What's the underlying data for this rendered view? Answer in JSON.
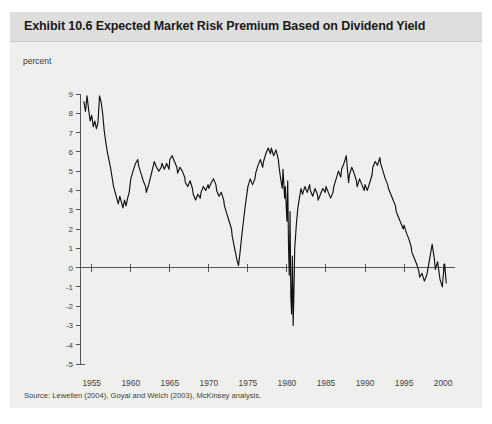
{
  "exhibit": {
    "title": "Exhibit 10.6 Expected Market Risk Premium Based on Dividend Yield",
    "unit_label": "percent",
    "source_note": "Source: Lewellen (2004), Goyal and Welch (2003), McKinsey analysis."
  },
  "colors": {
    "panel_background": "#efefed",
    "title_band": "#dededc",
    "series_line": "#121212",
    "axis": "#555555",
    "text": "#3f3f3f"
  },
  "chart_data": {
    "type": "line",
    "title": "Exhibit 10.6 Expected Market Risk Premium Based on Dividend Yield",
    "xlabel": "",
    "ylabel": "percent",
    "xlim": [
      1953.5,
      2000.5
    ],
    "ylim": [
      -5,
      9
    ],
    "grid": false,
    "legend": false,
    "x_ticks": [
      1955,
      1960,
      1965,
      1970,
      1975,
      1980,
      1985,
      1990,
      1995,
      2000
    ],
    "x_tick_labels": [
      "1955",
      "1960",
      "1965",
      "1970",
      "1975",
      "1980",
      "1985",
      "1990",
      "1995",
      "2000"
    ],
    "y_ticks": [
      9,
      8,
      7,
      6,
      5,
      4,
      3,
      2,
      1,
      0,
      -1,
      -2,
      -3,
      -4,
      -5
    ],
    "y_tick_labels": [
      "9",
      "8",
      "7",
      "6",
      "5",
      "4",
      "3",
      "2",
      "1",
      "0",
      "-1",
      "-2",
      "-3",
      "-4",
      "-5"
    ],
    "zero_line": 0,
    "series": [
      {
        "name": "Expected market risk premium",
        "x": [
          1954.0,
          1954.2,
          1954.4,
          1954.6,
          1954.8,
          1955.0,
          1955.2,
          1955.4,
          1955.6,
          1955.8,
          1956.0,
          1956.2,
          1956.4,
          1956.6,
          1956.8,
          1957.0,
          1957.2,
          1957.4,
          1957.6,
          1957.8,
          1958.0,
          1958.2,
          1958.4,
          1958.6,
          1958.8,
          1959.0,
          1959.2,
          1959.4,
          1959.6,
          1959.8,
          1960.0,
          1960.3,
          1960.6,
          1960.9,
          1961.0,
          1961.3,
          1961.6,
          1961.9,
          1962.0,
          1962.3,
          1962.6,
          1962.9,
          1963.0,
          1963.3,
          1963.6,
          1963.9,
          1964.0,
          1964.3,
          1964.6,
          1964.9,
          1965.0,
          1965.3,
          1965.6,
          1965.9,
          1966.0,
          1966.3,
          1966.6,
          1966.9,
          1967.0,
          1967.3,
          1967.6,
          1967.9,
          1968.0,
          1968.3,
          1968.6,
          1968.9,
          1969.0,
          1969.3,
          1969.6,
          1969.9,
          1970.0,
          1970.3,
          1970.6,
          1970.9,
          1971.0,
          1971.3,
          1971.6,
          1971.9,
          1972.0,
          1972.3,
          1972.6,
          1972.9,
          1973.0,
          1973.2,
          1973.4,
          1973.6,
          1973.8,
          1974.0,
          1974.2,
          1974.4,
          1974.6,
          1974.8,
          1975.0,
          1975.3,
          1975.6,
          1975.9,
          1976.0,
          1976.3,
          1976.6,
          1976.9,
          1977.0,
          1977.3,
          1977.6,
          1977.9,
          1978.0,
          1978.3,
          1978.6,
          1978.9,
          1979.0,
          1979.2,
          1979.4,
          1979.5,
          1979.6,
          1979.7,
          1979.8,
          1979.9,
          1980.0,
          1980.1,
          1980.2,
          1980.3,
          1980.4,
          1980.5,
          1980.6,
          1980.7,
          1980.8,
          1980.9,
          1981.0,
          1981.2,
          1981.4,
          1981.6,
          1981.8,
          1982.0,
          1982.3,
          1982.6,
          1982.9,
          1983.0,
          1983.3,
          1983.6,
          1983.9,
          1984.0,
          1984.3,
          1984.6,
          1984.9,
          1985.0,
          1985.3,
          1985.6,
          1985.9,
          1986.0,
          1986.3,
          1986.6,
          1986.9,
          1987.0,
          1987.3,
          1987.6,
          1987.9,
          1988.0,
          1988.3,
          1988.6,
          1988.9,
          1989.0,
          1989.3,
          1989.6,
          1989.9,
          1990.0,
          1990.3,
          1990.6,
          1990.9,
          1991.0,
          1991.3,
          1991.6,
          1991.9,
          1992.0,
          1992.3,
          1992.6,
          1992.9,
          1993.0,
          1993.3,
          1993.6,
          1993.9,
          1994.0,
          1994.3,
          1994.6,
          1994.9,
          1995.0,
          1995.3,
          1995.6,
          1995.9,
          1996.0,
          1996.3,
          1996.6,
          1996.9,
          1997.0,
          1997.3,
          1997.6,
          1997.9,
          1998.0,
          1998.3,
          1998.6,
          1998.9,
          1999.0,
          1999.3,
          1999.6,
          1999.9,
          2000.0,
          2000.2,
          2000.4
        ],
        "y": [
          8.6,
          8.1,
          8.9,
          8.2,
          7.6,
          7.9,
          7.3,
          7.6,
          7.2,
          7.5,
          8.9,
          8.6,
          8.0,
          7.1,
          6.5,
          6.0,
          5.6,
          5.2,
          4.7,
          4.2,
          3.9,
          3.6,
          3.3,
          3.7,
          3.4,
          3.1,
          3.5,
          3.2,
          3.6,
          3.9,
          4.6,
          5.0,
          5.4,
          5.6,
          5.3,
          4.9,
          4.5,
          4.2,
          3.9,
          4.3,
          4.8,
          5.3,
          5.5,
          5.2,
          5.0,
          5.2,
          5.4,
          5.1,
          5.4,
          5.1,
          5.6,
          5.8,
          5.5,
          5.2,
          4.9,
          5.2,
          5.0,
          4.7,
          4.4,
          4.2,
          4.5,
          4.1,
          3.8,
          3.5,
          3.8,
          3.6,
          3.9,
          4.2,
          4.0,
          4.3,
          4.1,
          4.4,
          4.6,
          4.3,
          4.0,
          3.7,
          3.9,
          3.5,
          3.2,
          2.8,
          2.4,
          2.0,
          1.6,
          1.2,
          0.8,
          0.4,
          0.1,
          0.8,
          1.6,
          2.3,
          3.0,
          3.6,
          4.2,
          4.6,
          4.3,
          4.6,
          4.9,
          5.3,
          5.6,
          5.2,
          5.5,
          5.9,
          6.2,
          5.9,
          6.2,
          5.8,
          6.1,
          5.6,
          5.2,
          4.6,
          4.1,
          5.1,
          4.4,
          3.6,
          4.2,
          3.3,
          2.4,
          4.5,
          1.2,
          -0.4,
          2.9,
          -1.5,
          -2.4,
          0.6,
          -3.0,
          -1.2,
          1.0,
          2.2,
          3.1,
          3.6,
          4.1,
          3.8,
          4.2,
          3.9,
          4.3,
          4.0,
          3.7,
          4.1,
          3.8,
          3.5,
          3.8,
          4.1,
          3.9,
          4.2,
          3.9,
          3.6,
          3.9,
          4.2,
          4.6,
          5.0,
          4.7,
          5.1,
          5.4,
          5.8,
          4.4,
          4.8,
          5.2,
          4.9,
          4.5,
          4.2,
          4.6,
          4.3,
          4.0,
          4.3,
          4.0,
          4.4,
          4.8,
          5.2,
          5.5,
          5.3,
          5.7,
          5.4,
          5.0,
          4.6,
          4.3,
          4.1,
          3.8,
          3.5,
          3.2,
          2.9,
          2.6,
          2.3,
          2.0,
          2.2,
          1.8,
          1.5,
          1.1,
          0.8,
          0.5,
          0.2,
          -0.2,
          -0.5,
          -0.3,
          -0.7,
          -0.4,
          -0.2,
          0.5,
          1.2,
          0.4,
          -0.1,
          0.3,
          -0.6,
          -1.0,
          -0.5,
          0.2,
          -0.8
        ]
      }
    ]
  }
}
